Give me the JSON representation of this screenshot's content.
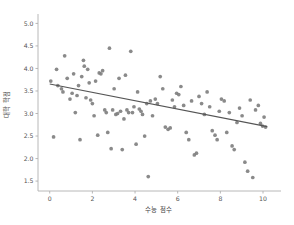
{
  "chart_data": {
    "type": "scatter",
    "title": "",
    "xlabel": "수능 점수",
    "ylabel": "대학 학점",
    "xlim": [
      -0.55,
      10.75
    ],
    "ylim": [
      1.28,
      5.12
    ],
    "xticks": [
      0,
      2,
      4,
      6,
      8,
      10
    ],
    "xtick_labels": [
      "0",
      "2",
      "4",
      "6",
      "8",
      "10"
    ],
    "yticks": [
      1.5,
      2.0,
      2.5,
      3.0,
      3.5,
      4.0,
      4.5,
      5.0
    ],
    "ytick_labels": [
      "1.5",
      "2.0",
      "2.5",
      "3.0",
      "3.5",
      "4.0",
      "4.5",
      "5.0"
    ],
    "grid": false,
    "legend": null,
    "marker_color": "#808080",
    "line_color": "#555555",
    "series": [
      {
        "name": "students",
        "marker": "circle",
        "x": [
          0.05,
          0.18,
          0.32,
          0.38,
          0.55,
          0.62,
          0.7,
          0.82,
          0.95,
          1.05,
          1.12,
          1.2,
          1.28,
          1.35,
          1.42,
          1.5,
          1.58,
          1.62,
          1.7,
          1.78,
          1.85,
          1.92,
          2.0,
          2.08,
          2.15,
          2.25,
          2.32,
          2.4,
          2.48,
          2.58,
          2.65,
          2.72,
          2.8,
          2.88,
          2.95,
          3.02,
          3.1,
          3.18,
          3.25,
          3.32,
          3.4,
          3.48,
          3.55,
          3.62,
          3.7,
          3.8,
          3.88,
          3.95,
          4.05,
          4.12,
          4.2,
          4.28,
          4.35,
          4.45,
          4.55,
          4.62,
          4.72,
          4.82,
          4.95,
          5.05,
          5.18,
          5.3,
          5.42,
          5.55,
          5.65,
          5.75,
          5.85,
          5.95,
          6.05,
          6.15,
          6.28,
          6.4,
          6.52,
          6.65,
          6.78,
          6.88,
          7.0,
          7.12,
          7.25,
          7.38,
          7.5,
          7.62,
          7.75,
          7.85,
          7.95,
          8.05,
          8.18,
          8.3,
          8.42,
          8.55,
          8.65,
          8.78,
          8.9,
          9.02,
          9.15,
          9.28,
          9.4,
          9.52,
          9.65,
          9.78,
          9.88,
          9.98,
          10.05,
          10.12
        ],
        "y": [
          3.72,
          2.48,
          3.98,
          3.62,
          3.55,
          3.48,
          4.28,
          3.78,
          3.32,
          3.45,
          3.88,
          3.02,
          3.4,
          3.62,
          2.42,
          3.82,
          4.18,
          4.05,
          3.35,
          3.98,
          3.68,
          3.3,
          3.22,
          2.95,
          3.72,
          2.52,
          3.9,
          3.88,
          3.95,
          3.08,
          3.02,
          2.58,
          4.45,
          2.22,
          3.08,
          3.55,
          2.98,
          3.0,
          3.78,
          3.05,
          2.2,
          2.88,
          3.85,
          3.08,
          3.02,
          4.38,
          3.02,
          3.15,
          2.32,
          3.48,
          3.1,
          3.05,
          2.98,
          2.5,
          3.22,
          1.6,
          3.28,
          2.95,
          3.32,
          3.22,
          3.82,
          3.55,
          2.7,
          2.65,
          2.68,
          3.3,
          3.15,
          3.45,
          3.42,
          3.6,
          3.18,
          2.58,
          2.42,
          3.28,
          2.08,
          2.12,
          3.38,
          3.22,
          2.98,
          3.48,
          3.15,
          2.62,
          2.52,
          2.42,
          3.05,
          3.32,
          3.28,
          2.58,
          3.02,
          2.28,
          2.2,
          2.8,
          3.12,
          2.95,
          1.92,
          1.72,
          3.3,
          1.58,
          3.08,
          3.18,
          2.78,
          2.72,
          2.92,
          2.7
        ]
      }
    ],
    "regression_line": {
      "x": [
        0.0,
        10.2
      ],
      "y": [
        3.655,
        2.71
      ]
    }
  }
}
